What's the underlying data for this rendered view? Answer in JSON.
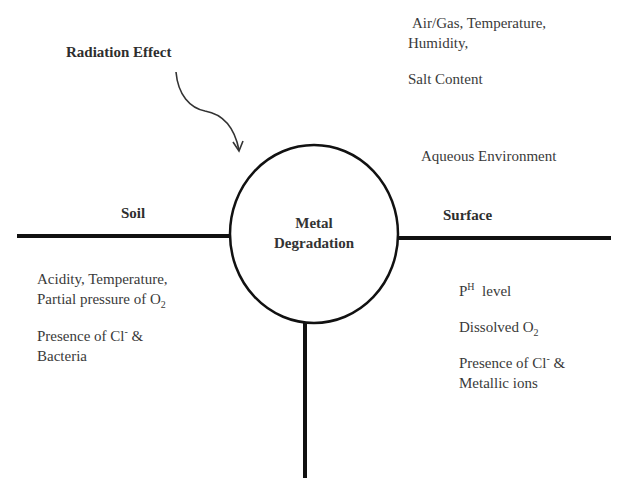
{
  "center": {
    "line1": "Metal",
    "line2": "Degradation"
  },
  "branches": {
    "left": {
      "title": "Soil",
      "items": [
        {
          "line1": "Acidity, Temperature,",
          "line2_prefix": "Partial pressure of O",
          "line2_sub": "2"
        },
        {
          "line1_prefix": "Presence of Cl",
          "line1_sup": "-",
          "line1_suffix": " &",
          "line2": "Bacteria"
        }
      ]
    },
    "right": {
      "title": "Surface",
      "items": [
        {
          "prefix": "P",
          "sup": "H",
          "suffix": "  level"
        },
        {
          "prefix": "Dissolved O",
          "sub": "2"
        },
        {
          "line1_prefix": "Presence of Cl",
          "line1_sup": "-",
          "line1_suffix": " &",
          "line2": "Metallic ions"
        }
      ]
    },
    "top_right": {
      "air": {
        "line1": "Air/Gas, Temperature,",
        "line2": "Humidity,",
        "line3": "Salt Content"
      },
      "aqueous": "Aqueous Environment"
    },
    "top_left": {
      "title": "Radiation Effect"
    }
  },
  "colors": {
    "line": "#111111",
    "text": "#3a3a3a",
    "background": "#ffffff"
  }
}
